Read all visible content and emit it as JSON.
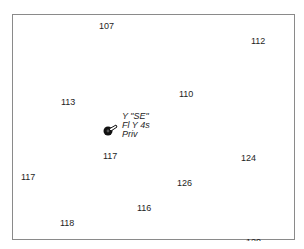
{
  "chart": {
    "frame_color": "#8a8a8a",
    "soundings": [
      {
        "value": "107",
        "x": 99,
        "y": 21
      },
      {
        "value": "112",
        "x": 251,
        "y": 36
      },
      {
        "value": "113",
        "x": 61,
        "y": 97
      },
      {
        "value": "110",
        "x": 179,
        "y": 89
      },
      {
        "value": "117",
        "x": 103,
        "y": 151
      },
      {
        "value": "124",
        "x": 241,
        "y": 153
      },
      {
        "value": "117",
        "x": 21,
        "y": 172
      },
      {
        "value": "126",
        "x": 177,
        "y": 178
      },
      {
        "value": "116",
        "x": 137,
        "y": 203
      },
      {
        "value": "118",
        "x": 60,
        "y": 218
      },
      {
        "value": "120",
        "x": 246,
        "y": 237
      }
    ],
    "buoy": {
      "icon": "light-buoy-icon",
      "color": "#111111",
      "label_lines": [
        "Y \"SE\"",
        "Fl Y 4s",
        "Priv"
      ]
    }
  }
}
